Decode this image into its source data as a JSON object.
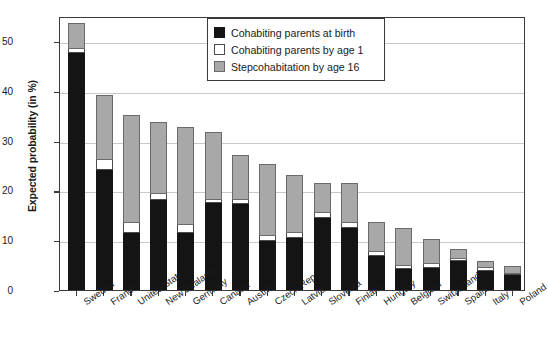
{
  "chart_data": {
    "type": "bar",
    "stacked": true,
    "title": "",
    "xlabel": "",
    "ylabel": "Expected probability (in %)",
    "ylim": [
      0,
      55
    ],
    "yticks": [
      0,
      10,
      20,
      30,
      40,
      50
    ],
    "grid": "horizontal",
    "legend_position": "top-center",
    "categories": [
      "Sweden",
      "France",
      "United States",
      "New Zealand",
      "Germany",
      "Canada",
      "Austria",
      "Czech Rep.",
      "Latvia",
      "Slovenia",
      "Finland",
      "Hungary",
      "Belgium",
      "Switzerland",
      "Spain",
      "Italy",
      "Poland"
    ],
    "series": [
      {
        "name": "Cohabiting parents at birth",
        "color": "#141414",
        "values": [
          47.5,
          24.0,
          11.5,
          18.0,
          11.5,
          17.5,
          17.2,
          9.8,
          10.5,
          14.5,
          12.5,
          6.8,
          4.2,
          4.5,
          5.9,
          3.9,
          3.0
        ]
      },
      {
        "name": "Cohabiting parents by age 1",
        "color": "#ffffff",
        "values": [
          0.8,
          2.0,
          2.0,
          1.2,
          1.5,
          0.6,
          0.8,
          1.0,
          1.0,
          1.0,
          1.0,
          0.8,
          0.7,
          0.8,
          0.3,
          0.5,
          0.3
        ]
      },
      {
        "name": "Stepcohabitation by age 16",
        "color": "#a8a8a8",
        "values": [
          5.2,
          13.0,
          21.5,
          14.3,
          19.5,
          13.4,
          9.0,
          14.2,
          11.3,
          5.8,
          7.7,
          5.8,
          7.3,
          4.7,
          1.8,
          1.2,
          1.4
        ]
      }
    ],
    "totals": [
      53.5,
      39.0,
      35.0,
      33.5,
      32.5,
      31.5,
      27.0,
      25.0,
      22.8,
      21.3,
      21.2,
      13.4,
      12.2,
      10.0,
      8.0,
      5.6,
      4.7
    ]
  },
  "legend": {
    "items": [
      {
        "label": "Cohabiting parents at birth",
        "swatch": "black-swatch"
      },
      {
        "label": "Cohabiting parents by age 1",
        "swatch": "white-swatch"
      },
      {
        "label": "Stepcohabitation by age 16",
        "swatch": "gray-swatch"
      }
    ]
  }
}
